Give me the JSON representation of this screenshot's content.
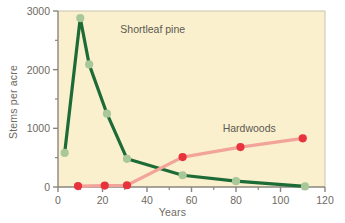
{
  "chart_data": {
    "type": "line",
    "title": "",
    "subtitle": "",
    "xlabel": "Years",
    "ylabel": "Stems per acre",
    "xlim": [
      0,
      120
    ],
    "ylim": [
      0,
      3000
    ],
    "x_major_ticks": [
      0,
      20,
      40,
      60,
      80,
      100,
      120
    ],
    "x_minor_ticks": [
      10,
      30,
      50,
      70,
      90,
      110
    ],
    "y_major_ticks": [
      0,
      1000,
      2000,
      3000
    ],
    "y_minor_ticks": [
      500,
      1500,
      2500
    ],
    "x_tick_labels": [
      "0",
      "20",
      "40",
      "60",
      "80",
      "100",
      "120"
    ],
    "y_tick_labels": [
      "0",
      "1000",
      "2000",
      "3000"
    ],
    "grid": false,
    "legend_position": "inline-annotation",
    "plot_background": "#faf0ce",
    "series": [
      {
        "name": "Shortleaf pine",
        "line_color": "#1d6b37",
        "marker_color": "#a9c89a",
        "label_x": 28,
        "label_y": 2620,
        "points": [
          {
            "x": 3,
            "y": 580
          },
          {
            "x": 10,
            "y": 2880
          },
          {
            "x": 14,
            "y": 2090
          },
          {
            "x": 22,
            "y": 1250
          },
          {
            "x": 31,
            "y": 480
          },
          {
            "x": 56,
            "y": 200
          },
          {
            "x": 80,
            "y": 100
          },
          {
            "x": 111,
            "y": 10
          }
        ]
      },
      {
        "name": "Hardwoods",
        "line_color": "#f2a49a",
        "marker_color": "#e8333c",
        "label_x": 74,
        "label_y": 930,
        "points": [
          {
            "x": 9,
            "y": 15
          },
          {
            "x": 21,
            "y": 25
          },
          {
            "x": 31,
            "y": 30
          },
          {
            "x": 56,
            "y": 510
          },
          {
            "x": 82,
            "y": 680
          },
          {
            "x": 110,
            "y": 830
          }
        ]
      }
    ]
  },
  "figure": {
    "axis_color": "#8a867d",
    "tick_label_color": "#6e6a63",
    "annotation_color": "#5d5a52"
  }
}
